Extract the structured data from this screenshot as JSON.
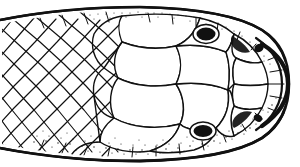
{
  "figure": {
    "title": "Snake head, dorsal view",
    "view": "dorsal",
    "technique": "pen-and-ink line drawing with stipple shading",
    "orientation": "snout to the right, neck cut off at the left",
    "background_color": "#ffffff",
    "ink_color": "#111111",
    "caption": ""
  },
  "anatomy": {
    "snout": {
      "label": "rostral snout tip",
      "position": "right"
    },
    "neck": {
      "label": "neck, cut edge",
      "position": "left"
    },
    "eyes": [
      {
        "label": "right eye",
        "cx": 206,
        "cy": 34,
        "rx": 9.5,
        "ry": 6.5,
        "fill": "#111111"
      },
      {
        "label": "left eye",
        "cx": 203,
        "cy": 131,
        "rx": 9.5,
        "ry": 6.0,
        "fill": "#111111"
      }
    ],
    "nostrils": [
      {
        "label": "upper nostril",
        "cx": 259,
        "cy": 48,
        "rx": 5.0,
        "ry": 4.0,
        "fill": "#111111"
      },
      {
        "label": "lower nostril",
        "cx": 258,
        "cy": 118,
        "rx": 4.5,
        "ry": 3.5,
        "fill": "#111111"
      }
    ],
    "regions": [
      {
        "name": "frontal-shield",
        "label": "frontal shield"
      },
      {
        "name": "parietal-shields",
        "label": "parietal shields"
      },
      {
        "name": "supraocular-shields",
        "label": "supraocular shields"
      },
      {
        "name": "prefrontal-shields",
        "label": "prefrontal shields"
      },
      {
        "name": "internasal-shields",
        "label": "internasal shields"
      },
      {
        "name": "nuchal-scales",
        "label": "nuchal and body scales"
      },
      {
        "name": "temporal-scales",
        "label": "temporal scales"
      },
      {
        "name": "supralabial-scales",
        "label": "supralabial scales"
      }
    ]
  },
  "shading": {
    "stipple_zones": [
      "lower jaw margin",
      "upper head margin",
      "snout rim",
      "around the eyes"
    ],
    "stipple_color": "#111111"
  }
}
